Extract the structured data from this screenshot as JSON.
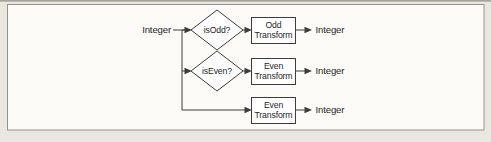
{
  "figure": {
    "type": "flowchart",
    "input_label": "Integer",
    "rows": [
      {
        "decision": "isOdd?",
        "process": [
          "Odd",
          "Transform"
        ],
        "output": "Integer"
      },
      {
        "decision": "isEven?",
        "process": [
          "Even",
          "Transform"
        ],
        "output": "Integer"
      },
      {
        "process": [
          "Even",
          "Transform"
        ],
        "output": "Integer"
      }
    ],
    "colors": {
      "line": "#3d3d3d",
      "text": "#1f1f1f",
      "shape_fill": "#ffffff",
      "frame_border": "#95928c",
      "frame_fill": "#fcfbf8",
      "page_background": "#eae7e0"
    }
  }
}
